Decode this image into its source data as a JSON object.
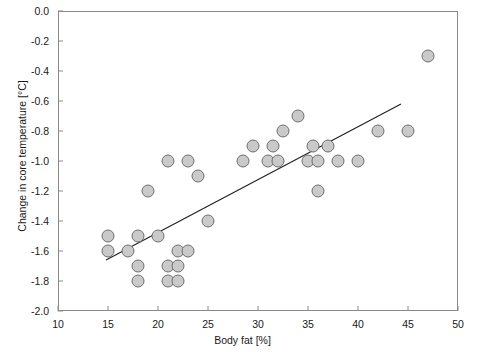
{
  "chart_data": {
    "type": "scatter",
    "title": "",
    "xlabel": "Body fat [%]",
    "ylabel": "Change in core temperature [°C]",
    "xlim": [
      10,
      50
    ],
    "ylim": [
      -2.0,
      0.0
    ],
    "xticks": [
      10,
      15,
      20,
      25,
      30,
      35,
      40,
      45,
      50
    ],
    "xtick_labels": [
      "10",
      "15",
      "20",
      "25",
      "30",
      "35",
      "40",
      "45",
      "50"
    ],
    "yticks": [
      0.0,
      -0.2,
      -0.4,
      -0.6,
      -0.8,
      -1.0,
      -1.2,
      -1.4,
      -1.6,
      -1.8,
      -2.0
    ],
    "ytick_labels": [
      "0.0",
      "-0.2",
      "-0.4",
      "-0.6",
      "-0.8",
      "-1.0",
      "-1.2",
      "-1.4",
      "-1.6",
      "-1.8",
      "-2.0"
    ],
    "grid": false,
    "legend": null,
    "marker": {
      "shape": "circle",
      "fill_color": "#c9c9c9",
      "edge_color": "#6e6e6e",
      "radius_px": 6
    },
    "points": [
      {
        "x": 15.0,
        "y": -1.5
      },
      {
        "x": 15.0,
        "y": -1.6
      },
      {
        "x": 17.0,
        "y": -1.6
      },
      {
        "x": 18.0,
        "y": -1.5
      },
      {
        "x": 18.0,
        "y": -1.7
      },
      {
        "x": 18.0,
        "y": -1.8
      },
      {
        "x": 19.0,
        "y": -1.2
      },
      {
        "x": 20.0,
        "y": -1.5
      },
      {
        "x": 21.0,
        "y": -1.0
      },
      {
        "x": 21.0,
        "y": -1.7
      },
      {
        "x": 21.0,
        "y": -1.8
      },
      {
        "x": 22.0,
        "y": -1.6
      },
      {
        "x": 22.0,
        "y": -1.7
      },
      {
        "x": 22.0,
        "y": -1.8
      },
      {
        "x": 23.0,
        "y": -1.0
      },
      {
        "x": 23.0,
        "y": -1.6
      },
      {
        "x": 24.0,
        "y": -1.1
      },
      {
        "x": 25.0,
        "y": -1.4
      },
      {
        "x": 28.5,
        "y": -1.0
      },
      {
        "x": 29.5,
        "y": -0.9
      },
      {
        "x": 31.0,
        "y": -1.0
      },
      {
        "x": 31.5,
        "y": -0.9
      },
      {
        "x": 32.0,
        "y": -1.0
      },
      {
        "x": 32.5,
        "y": -0.8
      },
      {
        "x": 34.0,
        "y": -0.7
      },
      {
        "x": 35.0,
        "y": -1.0
      },
      {
        "x": 35.5,
        "y": -0.9
      },
      {
        "x": 36.0,
        "y": -1.0
      },
      {
        "x": 36.0,
        "y": -1.2
      },
      {
        "x": 37.0,
        "y": -0.9
      },
      {
        "x": 38.0,
        "y": -1.0
      },
      {
        "x": 40.0,
        "y": -1.0
      },
      {
        "x": 42.0,
        "y": -0.8
      },
      {
        "x": 45.0,
        "y": -0.8
      },
      {
        "x": 47.0,
        "y": -0.3
      }
    ],
    "fit_line": {
      "type": "linear",
      "x_start": 14.8,
      "y_start": -1.66,
      "x_end": 44.3,
      "y_end": -0.62
    }
  }
}
